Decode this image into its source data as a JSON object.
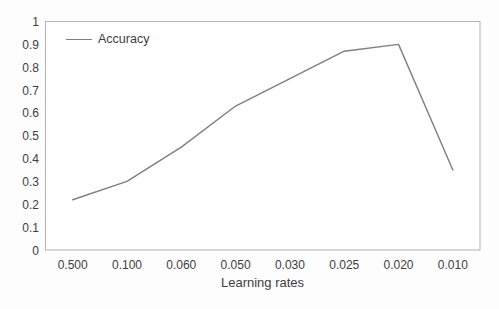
{
  "chart_data": {
    "type": "line",
    "title": "",
    "xlabel": "Learning rates",
    "ylabel": "",
    "categories": [
      "0.500",
      "0.100",
      "0.060",
      "0.050",
      "0.030",
      "0.025",
      "0.020",
      "0.010"
    ],
    "series": [
      {
        "name": "Accuracy",
        "values": [
          0.22,
          0.3,
          0.45,
          0.63,
          0.75,
          0.87,
          0.9,
          0.35
        ],
        "color": "#7f7f7f"
      }
    ],
    "ylim": [
      0,
      1
    ],
    "yticks": [
      "0",
      "0.1",
      "0.2",
      "0.3",
      "0.4",
      "0.5",
      "0.6",
      "0.7",
      "0.8",
      "0.9",
      "1"
    ],
    "grid": false,
    "legend_position": "top-left-inside",
    "plot_border_color": "#b3b3b3",
    "text_color": "#3d3d3d"
  }
}
